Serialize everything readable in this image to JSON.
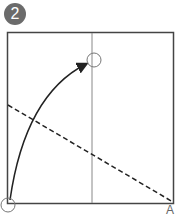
{
  "step": {
    "number": "2"
  },
  "diagram": {
    "corner_label": "A",
    "colors": {
      "stroke": "#333333",
      "crease": "#888888",
      "badge": "#6b6b6b"
    }
  }
}
